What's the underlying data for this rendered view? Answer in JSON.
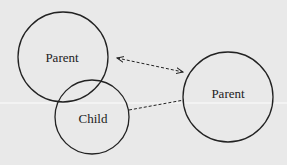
{
  "diagram": {
    "nodes": [
      {
        "id": "parent-left",
        "label": "Parent"
      },
      {
        "id": "child",
        "label": "Child"
      },
      {
        "id": "parent-right",
        "label": "Parent"
      }
    ],
    "edges": [
      {
        "from": "parent-left",
        "to": "parent-right",
        "style": "dashed",
        "arrows": "both"
      },
      {
        "from": "child",
        "to": "parent-right",
        "style": "dashed",
        "arrows": "none"
      }
    ],
    "colors": {
      "background": "#e9e9e9",
      "stroke": "#222222"
    }
  }
}
